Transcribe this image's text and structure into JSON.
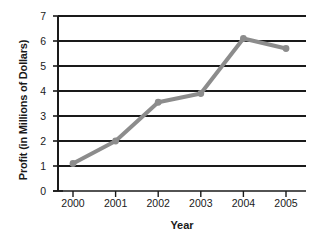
{
  "chart_data": {
    "type": "line",
    "title": "",
    "xlabel": "Year",
    "ylabel": "Profit (in Millions of Dollars)",
    "categories": [
      "2000",
      "2001",
      "2002",
      "2003",
      "2004",
      "2005"
    ],
    "x": [
      2000,
      2001,
      2002,
      2003,
      2004,
      2005
    ],
    "values": [
      1.1,
      2.0,
      3.55,
      3.9,
      6.1,
      5.7
    ],
    "series": [
      {
        "name": "Profit",
        "values": [
          1.1,
          2.0,
          3.55,
          3.9,
          6.1,
          5.7
        ],
        "color": "#8c8c8c",
        "marker": "circle"
      }
    ],
    "ylim": [
      0,
      7
    ],
    "yticks": [
      0,
      1,
      2,
      3,
      4,
      5,
      6,
      7
    ],
    "ytick_labels": [
      "0",
      "1",
      "2",
      "3",
      "4",
      "5",
      "6",
      "7"
    ],
    "xticks": [
      2000,
      2001,
      2002,
      2003,
      2004,
      2005
    ],
    "xtick_labels": [
      "2000",
      "2001",
      "2002",
      "2003",
      "2004",
      "2005"
    ],
    "grid": "horizontal",
    "grid_color": "#1a1a1a",
    "legend": "none",
    "legend_position": "none",
    "background": "#ffffff",
    "axis_color": "#1a1a1a"
  }
}
